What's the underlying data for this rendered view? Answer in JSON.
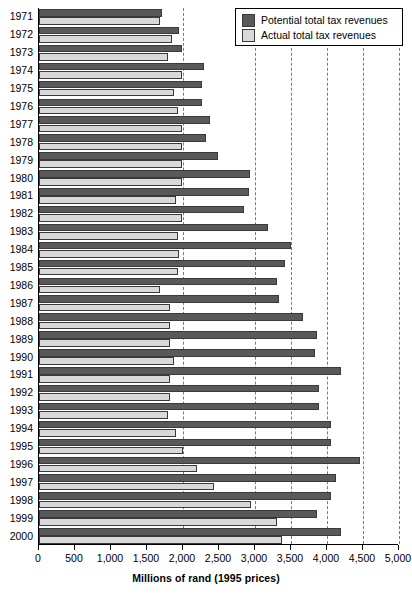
{
  "chart_data": {
    "type": "bar",
    "orientation": "horizontal",
    "title": "",
    "xlabel": "Millions of rand (1995 prices)",
    "ylabel": "",
    "xlim": [
      0,
      5000
    ],
    "xticks": [
      0,
      500,
      1000,
      1500,
      2000,
      2500,
      3000,
      3500,
      4000,
      4500,
      5000
    ],
    "xticklabels": [
      "0",
      "500",
      "1,000",
      "1,500",
      "2,000",
      "2,500",
      "3,000",
      "3,500",
      "4,000",
      "4,500",
      "5,000"
    ],
    "gridlines": [
      2000,
      3000,
      3500,
      4000,
      4500,
      5000
    ],
    "grid": "vertical-dashed",
    "legend_position": "top-right",
    "categories": [
      "1971",
      "1972",
      "1973",
      "1974",
      "1975",
      "1976",
      "1977",
      "1978",
      "1979",
      "1980",
      "1981",
      "1982",
      "1983",
      "1984",
      "1985",
      "1986",
      "1987",
      "1988",
      "1989",
      "1990",
      "1991",
      "1992",
      "1993",
      "1994",
      "1995",
      "1996",
      "1997",
      "1998",
      "1999",
      "2000"
    ],
    "series": [
      {
        "name": "Potential total tax revenues",
        "color": "#595959",
        "values": [
          1710,
          1950,
          1980,
          2290,
          2260,
          2260,
          2380,
          2320,
          2490,
          2930,
          2910,
          2850,
          3180,
          3500,
          3410,
          3310,
          3340,
          3660,
          3860,
          3840,
          4190,
          3890,
          3890,
          4050,
          4060,
          4460,
          4130,
          4050,
          3860,
          4190
        ]
      },
      {
        "name": "Actual total tax revenues",
        "color": "#d9d9d9",
        "values": [
          1680,
          1850,
          1790,
          1990,
          1880,
          1930,
          1990,
          1980,
          1990,
          1980,
          1900,
          1990,
          1930,
          1940,
          1930,
          1680,
          1820,
          1820,
          1820,
          1870,
          1820,
          1820,
          1790,
          1900,
          2000,
          2200,
          2430,
          2940,
          3300,
          3380
        ]
      }
    ]
  },
  "legend": {
    "items": [
      {
        "label": "Potential total tax revenues",
        "swatch": "potential"
      },
      {
        "label": "Actual total tax revenues",
        "swatch": "actual"
      }
    ]
  }
}
